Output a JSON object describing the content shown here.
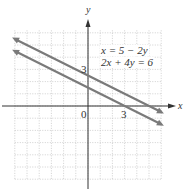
{
  "chart_data": {
    "type": "line",
    "title": "",
    "xlabel": "x",
    "ylabel": "y",
    "xlim": [
      -6,
      6
    ],
    "ylim": [
      -6,
      6
    ],
    "grid": true,
    "grid_style": "dotted",
    "tick_labels": {
      "x": [
        "0",
        "3"
      ],
      "y": [
        "3"
      ]
    },
    "legend": [
      "x = 5 − 2y",
      "2x + 4y = 6"
    ],
    "series": [
      {
        "name": "x = 5 − 2y",
        "slope": -0.5,
        "y_intercept": 2.5,
        "x_intercept": 5,
        "points": [
          [
            -6,
            5.5
          ],
          [
            6,
            -0.5
          ]
        ]
      },
      {
        "name": "2x + 4y = 6",
        "slope": -0.5,
        "y_intercept": 1.5,
        "x_intercept": 3,
        "points": [
          [
            -6,
            4.5
          ],
          [
            6,
            -1.5
          ]
        ]
      }
    ],
    "colors": {
      "lines": "#7a7a7a",
      "axes": "#333333",
      "grid": "#bdbdbd"
    }
  },
  "labels": {
    "x_axis": "x",
    "y_axis": "y",
    "origin": "0",
    "x_tick_3": "3",
    "y_tick_3": "3",
    "eq1": "x = 5 − 2y",
    "eq2": "2x + 4y = 6"
  }
}
